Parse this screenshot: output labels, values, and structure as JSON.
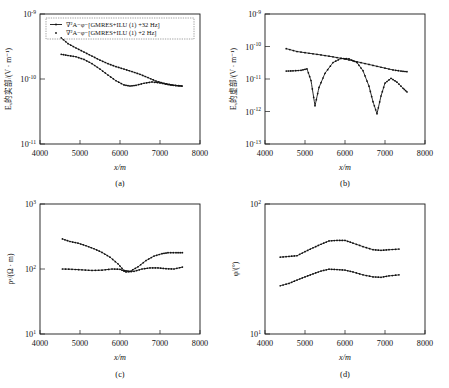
{
  "figure": {
    "layout": "2x2",
    "panels": [
      "a",
      "b",
      "c",
      "d"
    ]
  },
  "legend": {
    "entries": [
      {
        "marker": "line-plus-dot",
        "label": "∇²A−φ−[GMRES+ILU (1) +32 Hz]"
      },
      {
        "marker": "dot",
        "label": "∇²A−φ−[GMRES+ILU (1) +2 Hz]"
      }
    ],
    "panel": "a"
  },
  "axes": {
    "x_label": "x/m",
    "x_ticks": [
      "4000",
      "5000",
      "6000",
      "7000",
      "8000"
    ],
    "x_min": 4000,
    "x_max": 8000
  },
  "panel_a": {
    "letter": "(a)",
    "y_label": "Eₓ的实部/(V · m⁻¹)",
    "y_ticks": [
      "10",
      "10",
      "10"
    ],
    "y_exps": [
      "-9",
      "-10",
      "-11"
    ]
  },
  "panel_b": {
    "letter": "(b)",
    "y_label": "Eₓ的虚部/(V · m⁻¹)",
    "y_ticks": [
      "10",
      "10",
      "10",
      "10",
      "10"
    ],
    "y_exps": [
      "-9",
      "-10",
      "-11",
      "-12",
      "-13"
    ]
  },
  "panel_c": {
    "letter": "(c)",
    "y_label": "ρᵃ/(Ω · m)",
    "y_ticks": [
      "10",
      "10",
      "10"
    ],
    "y_exps": [
      "3",
      "2",
      "1"
    ]
  },
  "panel_d": {
    "letter": "(d)",
    "y_label": "φ/(°)",
    "y_ticks": [
      "10",
      "10"
    ],
    "y_exps": [
      "2",
      "1"
    ]
  },
  "chart_data": [
    {
      "type": "line",
      "panel": "a",
      "title": "",
      "xlabel": "x/m",
      "ylabel": "Ex real part /(V·m⁻¹)",
      "xlim": [
        4000,
        8000
      ],
      "ylim": [
        1e-11,
        1e-09
      ],
      "yscale": "log",
      "grid": false,
      "legend_position": "upper-left-inside",
      "series": [
        {
          "name": "∇²A−φ−[GMRES+ILU (1) +32 Hz]",
          "x": [
            4530,
            4700,
            4900,
            5100,
            5300,
            5500,
            5700,
            5900,
            6100,
            6300,
            6500,
            6700,
            6900,
            7100,
            7300,
            7550
          ],
          "y": [
            4.3e-10,
            3.5e-10,
            3e-10,
            2.6e-10,
            2.25e-10,
            1.95e-10,
            1.72e-10,
            1.55e-10,
            1.42e-10,
            1.3e-10,
            1.18e-10,
            1.05e-10,
            9.3e-11,
            8.6e-11,
            8.1e-11,
            7.8e-11
          ]
        },
        {
          "name": "∇²A−φ−[GMRES+ILU (1) +2 Hz]",
          "x": [
            4530,
            4700,
            4900,
            5100,
            5300,
            5500,
            5700,
            5900,
            6100,
            6250,
            6400,
            6600,
            6800,
            7000,
            7200,
            7400,
            7550
          ],
          "y": [
            2.4e-10,
            2.3e-10,
            2.2e-10,
            2e-10,
            1.72e-10,
            1.42e-10,
            1.15e-10,
            9.4e-11,
            8.1e-11,
            7.8e-11,
            8e-11,
            8.6e-11,
            9e-11,
            8.7e-11,
            8.2e-11,
            7.9e-11,
            7.8e-11
          ]
        }
      ]
    },
    {
      "type": "line",
      "panel": "b",
      "title": "",
      "xlabel": "x/m",
      "ylabel": "Ex imaginary part /(V·m⁻¹)",
      "xlim": [
        4000,
        8000
      ],
      "ylim": [
        1e-13,
        1e-09
      ],
      "yscale": "log",
      "grid": false,
      "series": [
        {
          "name": "∇²A−φ−[GMRES+ILU (1) +32 Hz]",
          "x": [
            4530,
            4800,
            5100,
            5400,
            5700,
            6000,
            6300,
            6600,
            6900,
            7200,
            7400,
            7550
          ],
          "y": [
            8.6e-11,
            7e-11,
            6.2e-11,
            5.5e-11,
            4.8e-11,
            4.1e-11,
            3.4e-11,
            2.8e-11,
            2.3e-11,
            1.9e-11,
            1.75e-11,
            1.68e-11
          ]
        },
        {
          "name": "∇²A−φ−[GMRES+ILU (1) +2 Hz]",
          "x": [
            4530,
            4700,
            4900,
            5050,
            5150,
            5250,
            5350,
            5500,
            5700,
            5900,
            6100,
            6300,
            6450,
            6600,
            6700,
            6800,
            6900,
            7000,
            7150,
            7300,
            7450,
            7550
          ],
          "y": [
            1.75e-11,
            1.78e-11,
            1.85e-11,
            2.05e-11,
            9e-12,
            1.5e-12,
            5.5e-12,
            1.5e-11,
            3.2e-11,
            4.3e-11,
            4.2e-11,
            3.2e-11,
            1.8e-11,
            6e-12,
            2e-12,
            8.5e-13,
            3e-12,
            7.5e-12,
            1.05e-11,
            8e-12,
            5.2e-12,
            4e-12
          ]
        }
      ]
    },
    {
      "type": "line",
      "panel": "c",
      "title": "",
      "xlabel": "x/m",
      "ylabel": "ρᵃ/(Ω·m)",
      "xlim": [
        4000,
        8000
      ],
      "ylim": [
        10,
        1000
      ],
      "yscale": "log",
      "grid": false,
      "series": [
        {
          "name": "∇²A−φ−[GMRES+ILU (1) +32 Hz]",
          "x": [
            4560,
            4750,
            4950,
            5150,
            5350,
            5550,
            5750,
            5950,
            6100,
            6250,
            6450,
            6650,
            6850,
            7050,
            7200,
            7400,
            7560
          ],
          "y": [
            290,
            265,
            250,
            228,
            205,
            180,
            152,
            120,
            95,
            92,
            108,
            135,
            158,
            172,
            178,
            178,
            178
          ]
        },
        {
          "name": "∇²A−φ−[GMRES+ILU (1) +2 Hz]",
          "x": [
            4560,
            4800,
            5050,
            5300,
            5550,
            5800,
            6000,
            6150,
            6350,
            6550,
            6750,
            6950,
            7150,
            7350,
            7560
          ],
          "y": [
            100,
            99,
            97,
            95,
            96,
            100,
            99,
            90,
            92,
            100,
            104,
            104,
            101,
            100,
            107
          ]
        }
      ]
    },
    {
      "type": "line",
      "panel": "d",
      "title": "",
      "xlabel": "x/m",
      "ylabel": "φ/(°)",
      "xlim": [
        4000,
        8000
      ],
      "ylim": [
        10,
        100
      ],
      "yscale": "log",
      "grid": false,
      "series": [
        {
          "name": "∇²A−φ−[GMRES+ILU (1) +32 Hz]",
          "x": [
            4380,
            4600,
            4800,
            5000,
            5200,
            5400,
            5600,
            5800,
            6000,
            6200,
            6450,
            6700,
            6900,
            7100,
            7350
          ],
          "y": [
            39,
            39.5,
            40,
            43,
            46,
            49,
            52,
            52.5,
            52.5,
            50,
            47,
            44.5,
            44,
            44.5,
            45
          ]
        },
        {
          "name": "∇²A−φ−[GMRES+ILU (1) +2 Hz]",
          "x": [
            4380,
            4600,
            4800,
            5000,
            5200,
            5400,
            5600,
            5800,
            6000,
            6200,
            6450,
            6700,
            6900,
            7100,
            7350
          ],
          "y": [
            23.5,
            24.5,
            26,
            27.5,
            29,
            30.5,
            31.5,
            31.3,
            31,
            30,
            28.5,
            27.5,
            27.3,
            28,
            28.5
          ]
        }
      ]
    }
  ]
}
